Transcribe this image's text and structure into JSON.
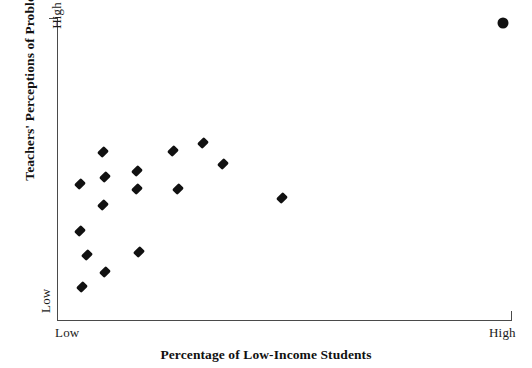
{
  "chart_data": {
    "type": "scatter",
    "title": "",
    "xlabel": "Percentage of Low-Income Students",
    "ylabel": "Teachers' Perceptions of Problems",
    "x_tick_labels": [
      "Low",
      "High"
    ],
    "y_tick_labels": [
      "Low",
      "High"
    ],
    "xlim": [
      0,
      100
    ],
    "ylim": [
      0,
      100
    ],
    "grid": false,
    "legend": null,
    "axis_color": "#4a4a4a",
    "marker_color": "#111111",
    "series": [
      {
        "name": "Schools",
        "marker": "diamond",
        "points": [
          {
            "x": 5.0,
            "y": 29.5
          },
          {
            "x": 5.0,
            "y": 45.0
          },
          {
            "x": 5.5,
            "y": 11.0
          },
          {
            "x": 6.5,
            "y": 21.5
          },
          {
            "x": 10.0,
            "y": 55.5
          },
          {
            "x": 10.0,
            "y": 38.0
          },
          {
            "x": 10.5,
            "y": 47.5
          },
          {
            "x": 10.5,
            "y": 16.0
          },
          {
            "x": 17.5,
            "y": 49.5
          },
          {
            "x": 17.5,
            "y": 43.5
          },
          {
            "x": 18.0,
            "y": 22.5
          },
          {
            "x": 25.5,
            "y": 56.0
          },
          {
            "x": 26.5,
            "y": 43.5
          },
          {
            "x": 32.0,
            "y": 58.5
          },
          {
            "x": 36.5,
            "y": 51.5
          },
          {
            "x": 49.5,
            "y": 40.5
          }
        ]
      },
      {
        "name": "Outlier",
        "marker": "circle",
        "points": [
          {
            "x": 98.0,
            "y": 98.5
          }
        ]
      }
    ]
  }
}
